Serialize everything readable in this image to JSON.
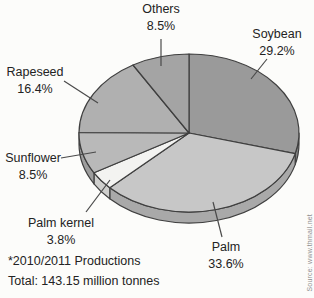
{
  "chart_data": {
    "type": "pie",
    "style": "3d",
    "direction": "clockwise",
    "start_angle_deg": 0,
    "title": "",
    "slices": [
      {
        "label": "Soybean",
        "value": 29.2,
        "pct_label": "29.2%",
        "color": "#9a9a9a"
      },
      {
        "label": "Palm",
        "value": 33.6,
        "pct_label": "33.6%",
        "color": "#c7c7c7"
      },
      {
        "label": "Palm kernel",
        "value": 3.8,
        "pct_label": "3.8%",
        "color": "#f3f3f1"
      },
      {
        "label": "Sunflower",
        "value": 8.5,
        "pct_label": "8.5%",
        "color": "#b9b9b9"
      },
      {
        "label": "Rapeseed",
        "value": 16.4,
        "pct_label": "16.4%",
        "color": "#b0b0b0"
      },
      {
        "label": "Others",
        "value": 8.5,
        "pct_label": "8.5%",
        "color": "#a4a4a4"
      }
    ],
    "footnote": "*2010/2011 Productions",
    "total_label": "Total: 143.15 million tonnes",
    "source": "Source: www.thmail.net"
  }
}
